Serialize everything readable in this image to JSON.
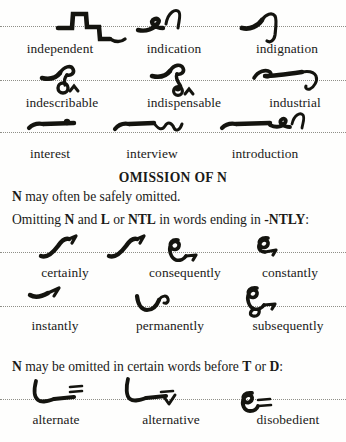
{
  "page": {
    "ink_color": "#14140f",
    "paper_color": "#fefefd",
    "rule_color": "#8a8a82"
  },
  "sections": [
    {
      "id": "in-prefix-row-1",
      "words": [
        "independent",
        "indication",
        "indignation"
      ]
    },
    {
      "id": "in-prefix-row-2",
      "words": [
        "indescribable",
        "indispensable",
        "industrial"
      ]
    },
    {
      "id": "inter-intro-row-3",
      "words": [
        "interest",
        "interview",
        "introduction"
      ]
    }
  ],
  "heading": "OMISSION OF N",
  "rule_line_1": {
    "bold_lead": "N",
    "rest": " may often be safely omitted."
  },
  "rule_line_2": {
    "part1": "Omitting ",
    "bold1": "N",
    "part2": " and ",
    "bold2": "L",
    "part3": " or ",
    "bold3": "NTL",
    "part4": " in words ending in ",
    "bold4": "-NTLY",
    "part5": ":"
  },
  "ntly_row_1": {
    "alt_note": {
      "line1": "or",
      "line2": "even"
    },
    "words": [
      "certainly",
      "consequently",
      "constantly"
    ]
  },
  "ntly_row_2": {
    "words": [
      "instantly",
      "permanently",
      "subsequently"
    ]
  },
  "rule_line_3": {
    "bold_lead": "N",
    "part1": " may be omitted in certain words before ",
    "bold1": "T",
    "part2": " or ",
    "bold2": "D",
    "part3": ":"
  },
  "td_row": {
    "words": [
      "alternate",
      "alternative",
      "disobedient"
    ]
  },
  "outlines": [
    {
      "word": "independent",
      "shape": "zigzag-descending-stroke"
    },
    {
      "word": "indication",
      "shape": "small-hook-with-upright-curve"
    },
    {
      "word": "indignation",
      "shape": "curve-with-n-loop"
    },
    {
      "word": "indescribable",
      "shape": "hook-with-circle-and-caret"
    },
    {
      "word": "indispensable",
      "shape": "hook-loop-circle-caret"
    },
    {
      "word": "industrial",
      "shape": "long-horizontal-with-down-curve"
    },
    {
      "word": "interest",
      "shape": "horizontal-bar-with-dot"
    },
    {
      "word": "interview",
      "shape": "horizontal-bar-with-wave"
    },
    {
      "word": "introduction",
      "shape": "horizontal-bar-with-hook-and-curve"
    },
    {
      "word": "certainly",
      "shape": "upward-stroke-with-tick"
    },
    {
      "word": "certainly-alt",
      "shape": "upward-stroke-with-tick"
    },
    {
      "word": "consequently",
      "shape": "loop-with-hook"
    },
    {
      "word": "constantly",
      "shape": "small-loop-with-tick"
    },
    {
      "word": "instantly",
      "shape": "short-horizontal-with-tick"
    },
    {
      "word": "permanently",
      "shape": "v-curve-with-hook"
    },
    {
      "word": "subsequently",
      "shape": "double-loop-with-hook"
    },
    {
      "word": "alternate",
      "shape": "hook-horizontal-with-dash"
    },
    {
      "word": "alternative",
      "shape": "hook-horizontal-with-v"
    },
    {
      "word": "disobedient",
      "shape": "loop-with-dash"
    }
  ]
}
